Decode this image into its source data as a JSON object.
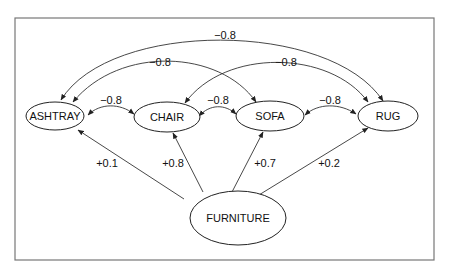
{
  "diagram": {
    "nodes": {
      "ashtray": "ASHTRAY",
      "chair": "CHAIR",
      "sofa": "SOFA",
      "rug": "RUG",
      "furniture": "FURNITURE"
    },
    "edges": {
      "ashtray_rug": "−0.8",
      "ashtray_sofa": "−0.8",
      "chair_rug": "−0.8",
      "ashtray_chair": "−0.8",
      "chair_sofa": "−0.8",
      "sofa_rug": "−0.8",
      "furniture_ashtray": "+0.1",
      "furniture_chair": "+0.8",
      "furniture_sofa": "+0.7",
      "furniture_rug": "+0.2"
    },
    "colors": {
      "frame": "#777777",
      "stroke": "#222222",
      "background": "#ffffff"
    }
  }
}
